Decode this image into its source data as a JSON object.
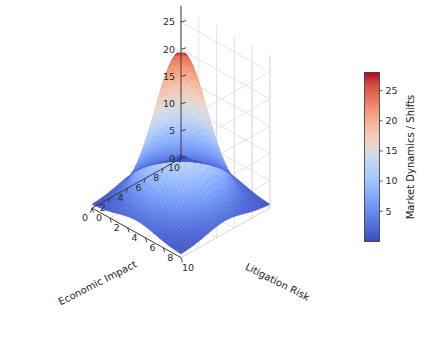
{
  "figure": {
    "background_color": "#ffffff",
    "type": "surface3d"
  },
  "chart_data": {
    "type": "surface",
    "title": "",
    "xlabel": "Economic Impact",
    "ylabel": "Litigation Risk",
    "zlabel": "",
    "colorbar_label": "Market Dynamics / Shifts",
    "colormap": "coolwarm",
    "xlim": [
      0,
      10
    ],
    "ylim": [
      0,
      10
    ],
    "zlim": [
      0,
      28
    ],
    "clim": [
      0,
      28
    ],
    "grid": true,
    "legend": "none",
    "view": {
      "elev": 28,
      "azim": -60
    },
    "x_ticks": [
      10,
      8,
      6,
      4,
      2,
      0
    ],
    "y_ticks": [
      0,
      2,
      4,
      6,
      8,
      10
    ],
    "z_ticks": [
      0,
      5,
      10,
      15,
      20,
      25
    ],
    "colorbar_ticks": [
      5,
      10,
      15,
      20,
      25
    ],
    "surface_model": {
      "form": "gaussian_peak",
      "amplitude": 28,
      "x_center": 5.0,
      "y_center": 5.0,
      "x_sigma": 2.1,
      "y_sigma": 2.1,
      "baseline": 0.6,
      "grid_n": 46
    },
    "x": [
      0,
      1,
      2,
      3,
      4,
      5,
      6,
      7,
      8,
      9,
      10
    ],
    "y": [
      0,
      1,
      2,
      3,
      4,
      5,
      6,
      7,
      8,
      9,
      10
    ],
    "z": [
      [
        0.6,
        0.7,
        0.9,
        1.3,
        1.7,
        1.9,
        1.7,
        1.3,
        0.9,
        0.7,
        0.6
      ],
      [
        0.7,
        1.0,
        1.7,
        2.8,
        4.0,
        4.6,
        4.0,
        2.8,
        1.7,
        1.0,
        0.7
      ],
      [
        0.9,
        1.7,
        3.4,
        6.1,
        9.0,
        10.4,
        9.0,
        6.1,
        3.4,
        1.7,
        0.9
      ],
      [
        1.3,
        2.8,
        6.1,
        11.0,
        16.3,
        18.9,
        16.3,
        11.0,
        6.1,
        2.8,
        1.3
      ],
      [
        1.7,
        4.0,
        9.0,
        16.3,
        24.1,
        27.9,
        24.1,
        16.3,
        9.0,
        4.0,
        1.7
      ],
      [
        1.9,
        4.6,
        10.4,
        18.9,
        27.9,
        28.0,
        27.9,
        18.9,
        10.4,
        4.6,
        1.9
      ],
      [
        1.7,
        4.0,
        9.0,
        16.3,
        24.1,
        27.9,
        24.1,
        16.3,
        9.0,
        4.0,
        1.7
      ],
      [
        1.3,
        2.8,
        6.1,
        11.0,
        16.3,
        18.9,
        16.3,
        11.0,
        6.1,
        2.8,
        1.3
      ],
      [
        0.9,
        1.7,
        3.4,
        6.1,
        9.0,
        10.4,
        9.0,
        6.1,
        3.4,
        1.7,
        0.9
      ],
      [
        0.7,
        1.0,
        1.7,
        2.8,
        4.0,
        4.6,
        4.0,
        2.8,
        1.7,
        1.0,
        0.7
      ],
      [
        0.6,
        0.7,
        0.9,
        1.3,
        1.7,
        1.9,
        1.7,
        1.3,
        0.9,
        0.7,
        0.6
      ]
    ],
    "colorbar": {
      "min_color": "#3b4cc0",
      "mid_color": "#f2f2f2",
      "max_color": "#b40426",
      "orientation": "vertical"
    }
  },
  "axes": {
    "x_axis_title": "Economic Impact",
    "y_axis_title": "Litigation Risk",
    "x_tick_labels": [
      "10",
      "8",
      "6",
      "4",
      "2",
      "0"
    ],
    "y_tick_labels": [
      "0",
      "2",
      "4",
      "6",
      "8",
      "10"
    ],
    "z_tick_labels": [
      "0",
      "5",
      "10",
      "15",
      "20",
      "25"
    ]
  },
  "colorbar_ui": {
    "label": "Market Dynamics / Shifts",
    "tick_labels": [
      "5",
      "10",
      "15",
      "20",
      "25"
    ]
  }
}
